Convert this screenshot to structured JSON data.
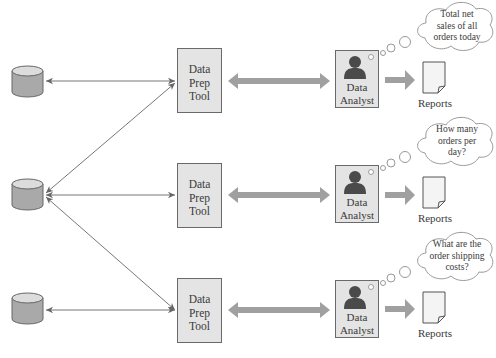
{
  "diagram": {
    "type": "data-flow",
    "rows": [
      {
        "database": {
          "icon": "database-icon"
        },
        "prep_tool": {
          "label_lines": [
            "Data",
            "Prep",
            "Tool"
          ]
        },
        "analyst": {
          "icon": "person-icon",
          "label_lines": [
            "Data",
            "Analyst"
          ]
        },
        "report": {
          "icon": "document-icon",
          "label": "Reports"
        },
        "thought": {
          "lines": [
            "Total net",
            "sales of all",
            "orders today"
          ]
        }
      },
      {
        "database": {
          "icon": "database-icon"
        },
        "prep_tool": {
          "label_lines": [
            "Data",
            "Prep",
            "Tool"
          ]
        },
        "analyst": {
          "icon": "person-icon",
          "label_lines": [
            "Data",
            "Analyst"
          ]
        },
        "report": {
          "icon": "document-icon",
          "label": "Reports"
        },
        "thought": {
          "lines": [
            "How many",
            "orders per",
            "day?"
          ]
        }
      },
      {
        "database": {
          "icon": "database-icon"
        },
        "prep_tool": {
          "label_lines": [
            "Data",
            "Prep",
            "Tool"
          ]
        },
        "analyst": {
          "icon": "person-icon",
          "label_lines": [
            "Data",
            "Analyst"
          ]
        },
        "report": {
          "icon": "document-icon",
          "label": "Reports"
        },
        "thought": {
          "lines": [
            "What are the",
            "order shipping",
            "costs?"
          ]
        }
      }
    ],
    "connections": [
      {
        "from": "database-1",
        "to": "prep-tool-1",
        "style": "thin-double-arrow"
      },
      {
        "from": "database-2",
        "to": "prep-tool-1",
        "style": "thin-double-arrow"
      },
      {
        "from": "database-2",
        "to": "prep-tool-2",
        "style": "thin-double-arrow"
      },
      {
        "from": "database-2",
        "to": "prep-tool-3",
        "style": "thin-double-arrow"
      },
      {
        "from": "database-3",
        "to": "prep-tool-3",
        "style": "thin-double-arrow"
      },
      {
        "from": "prep-tool",
        "to": "analyst",
        "style": "thick-double-arrow"
      },
      {
        "from": "analyst",
        "to": "report",
        "style": "thick-arrow"
      }
    ],
    "colors": {
      "box_fill": "#e4e4e4",
      "box_border": "#6a6a6a",
      "arrow_thick": "#a0a0a0",
      "line_thin": "#777777",
      "database_fill": "#a9a9a9",
      "database_top": "#dcdcdc",
      "person": "#4a4a4a"
    }
  }
}
